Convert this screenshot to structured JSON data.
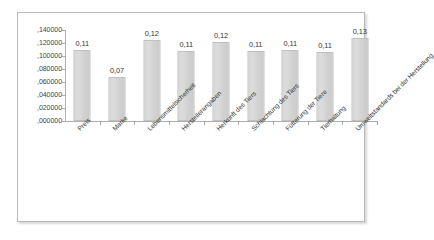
{
  "chart_data": {
    "type": "bar",
    "title": "",
    "xlabel": "",
    "ylabel": "",
    "categories": [
      "Preis",
      "Marke",
      "Lebensmittelsicherheit",
      "Herstellerangaben",
      "Herkunft des Tiers",
      "Schlachtung des Tiers",
      "Fütterung der Tiere",
      "Tierhaltung",
      "Umweltstandards bei der Herstellung"
    ],
    "values": [
      0.109,
      0.068,
      0.124,
      0.108,
      0.121,
      0.107,
      0.109,
      0.106,
      0.127
    ],
    "data_labels": [
      "0,11",
      "0,07",
      "0,12",
      "0,11",
      "0,12",
      "0,11",
      "0,11",
      "0,11",
      "0,13"
    ],
    "ylim": [
      0.0,
      0.14
    ],
    "ytick_values": [
      0.0,
      0.02,
      0.04,
      0.06,
      0.08,
      0.1,
      0.12,
      0.14
    ],
    "ytick_labels": [
      ",000000",
      ",020000",
      ",040000",
      ",060000",
      ",080000",
      ",100000",
      ",120000",
      ",140000"
    ],
    "grid": false,
    "legend": false,
    "decimal_separator": ",",
    "colors": {
      "bar_fill": "#d4d4d4",
      "bar_border": "#bdbdbd",
      "axis": "#aaaaaa",
      "text": "#2e2e2e",
      "frame_border": "#b9b9b9",
      "background": "#ffffff"
    }
  }
}
